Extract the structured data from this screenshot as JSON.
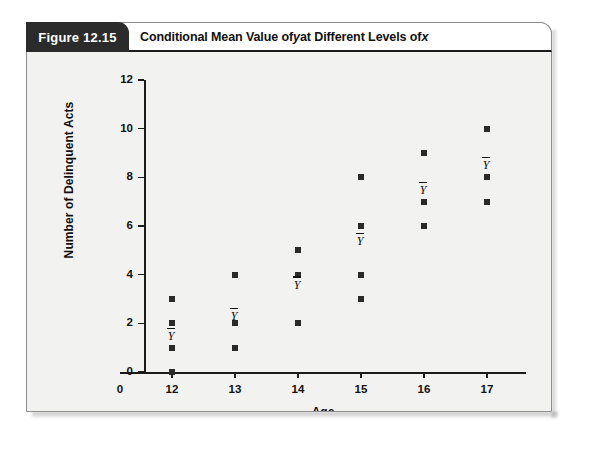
{
  "figure": {
    "tab_label": "Figure 12.15",
    "title_prefix": "Conditional Mean Value of ",
    "title_var1": "y",
    "title_middle": " at Different Levels of ",
    "title_var2": "x",
    "accent_color": "#2b2b2b",
    "panel_color": "#f2f2f0",
    "marker_color": "#2a2a2a"
  },
  "chart_data": {
    "type": "scatter",
    "title": "Conditional Mean Value of y at Different Levels of x",
    "xlabel": "Age",
    "ylabel": "Number of Delinquent Acts",
    "xlim": [
      11.45,
      17.55
    ],
    "ylim": [
      0,
      12
    ],
    "grid": false,
    "legend": null,
    "xticks": [
      0,
      12,
      13,
      14,
      15,
      16,
      17
    ],
    "xtick_labels": [
      "0",
      "12",
      "13",
      "14",
      "15",
      "16",
      "17"
    ],
    "yticks": [
      0,
      2,
      4,
      6,
      8,
      10,
      12
    ],
    "ytick_labels": [
      "0",
      "2",
      "4",
      "6",
      "8",
      "10",
      "12"
    ],
    "mean_marker_text": "Y",
    "mean_marker_overbar": true,
    "groups": [
      {
        "x": 12,
        "y_values": [
          0,
          1,
          2,
          3
        ],
        "conditional_mean": 1.5
      },
      {
        "x": 13,
        "y_values": [
          1,
          2,
          4
        ],
        "conditional_mean": 2.3
      },
      {
        "x": 14,
        "y_values": [
          2,
          4,
          5
        ],
        "conditional_mean": 3.6
      },
      {
        "x": 15,
        "y_values": [
          3,
          4,
          6,
          8
        ],
        "conditional_mean": 5.4
      },
      {
        "x": 16,
        "y_values": [
          6,
          7,
          9
        ],
        "conditional_mean": 7.5
      },
      {
        "x": 17,
        "y_values": [
          7,
          8,
          10
        ],
        "conditional_mean": 8.5
      }
    ]
  }
}
